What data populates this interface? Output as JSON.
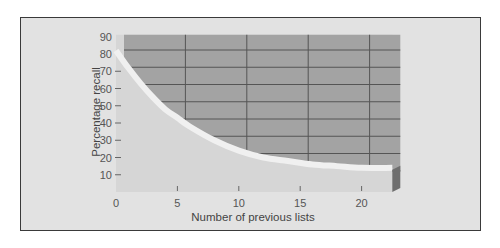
{
  "chart_data": {
    "type": "area",
    "title": "",
    "xlabel": "Number of previous lists",
    "ylabel": "Percentage recall",
    "x_ticks": [
      "0",
      "5",
      "10",
      "15",
      "20"
    ],
    "y_ticks": [
      "10",
      "20",
      "30",
      "40",
      "50",
      "60",
      "70",
      "80",
      "90"
    ],
    "xlim": [
      0,
      22.5
    ],
    "ylim": [
      0,
      90
    ],
    "grid": true,
    "legend": null,
    "series": [
      {
        "name": "Percentage recall",
        "x": [
          0,
          1,
          2,
          3,
          4,
          5,
          6,
          8,
          10,
          12,
          14,
          16,
          18,
          20,
          22.5
        ],
        "values": [
          82,
          72,
          63,
          55,
          48,
          43,
          38,
          30,
          24,
          20,
          18,
          16,
          15,
          14,
          14
        ]
      }
    ],
    "style": {
      "back_wall_color": "#a3a3a3",
      "floor_color": "#d6d6d6",
      "curve_band_color": "#f0f0f0",
      "panel_color": "#e2e2e2",
      "side_color": "#6e6e6e"
    }
  }
}
